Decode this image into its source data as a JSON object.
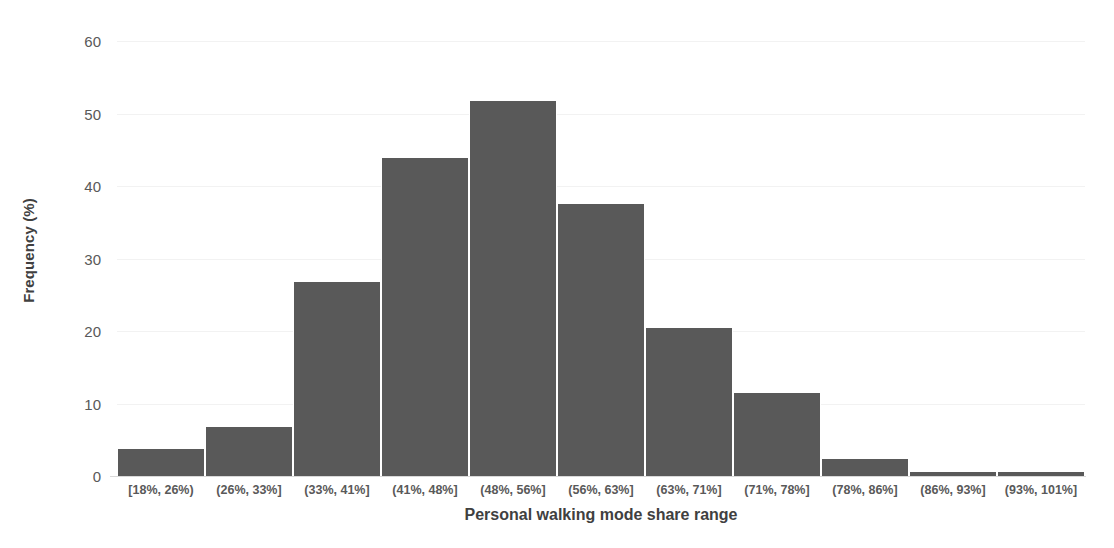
{
  "chart_data": {
    "type": "bar",
    "title": "",
    "subtitle": "",
    "xlabel": "Personal walking mode share range",
    "ylabel": "Frequency (%)",
    "categories": [
      "[18%, 26%)",
      "(26%, 33%]",
      "(33%, 41%]",
      "(41%, 48%]",
      "(48%, 56%]",
      "(56%, 63%]",
      "(63%, 71%]",
      "(71%, 78%]",
      "(78%, 86%]",
      "(86%, 93%]",
      "(93%, 101%]"
    ],
    "values": [
      3.7,
      6.7,
      26.7,
      43.8,
      51.7,
      37.5,
      20.4,
      11.5,
      2.4,
      0.5,
      0.5
    ],
    "ylim": [
      0,
      60
    ],
    "yticks": [
      0,
      10,
      20,
      30,
      40,
      50,
      60
    ],
    "ytick_labels": [
      "0",
      "10",
      "20",
      "30",
      "40",
      "50",
      "60"
    ],
    "grid": true,
    "grid_axis": "y",
    "legend": false,
    "legend_position": "none",
    "bar_color": "#595959",
    "gridline_color": "#f2f2f2",
    "axis_color": "#d9d9d9",
    "tick_label_color": "#595959",
    "axis_title_color": "#404040",
    "background_color": "#ffffff"
  }
}
